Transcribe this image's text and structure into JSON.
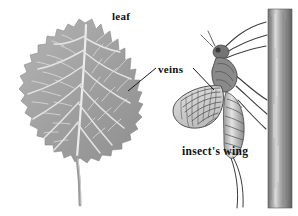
{
  "figure": {
    "background_color": "#ffffff",
    "width": 298,
    "height": 216
  },
  "labels": {
    "leaf": "leaf",
    "veins": "veins",
    "insect_wing": "insect's wing"
  },
  "objects": {
    "leaf": {
      "name": "leaf-illustration",
      "description": "serrated broad leaf with pale branching veins",
      "blade_color": "#a0a0a0",
      "vein_color": "#e8e8e8",
      "petiole_color": "#9a9a9a"
    },
    "insect": {
      "name": "mayfly-illustration",
      "description": "mayfly clinging to a vertical plant stem with veined wing and two long cerci",
      "body_color": "#6d6d6d",
      "wing_color": "#cfcfcf",
      "wing_vein_color": "#4a4a4a"
    },
    "stem": {
      "name": "plant-stem",
      "description": "vertical woody stem at right edge",
      "color": "#8e8e8e",
      "highlight_color": "#d8d8d8"
    }
  },
  "leader_lines": {
    "veins_to_leaf": "line from veins label down-left to leaf blade",
    "veins_to_wing": "line from veins label down-right to insect wing"
  }
}
